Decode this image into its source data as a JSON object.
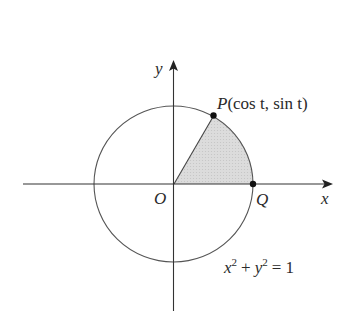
{
  "diagram": {
    "type": "unit-circle-sector",
    "axes": {
      "x_label": "x",
      "y_label": "y"
    },
    "points": {
      "origin": {
        "label": "O"
      },
      "P": {
        "label_name": "P",
        "label_coords": "(cos t, sin t)"
      },
      "Q": {
        "label": "Q"
      }
    },
    "equation": {
      "base_x": "x",
      "exp_x": "2",
      "plus": "+",
      "base_y": "y",
      "exp_y": "2",
      "rhs": "= 1"
    },
    "colors": {
      "stroke": "#4a4a4a",
      "sector_fill": "#d9d9d9",
      "point": "#111111",
      "text": "#2a2a2a"
    }
  }
}
